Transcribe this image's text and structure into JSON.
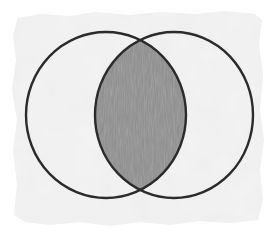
{
  "diagram": {
    "type": "venn",
    "sets": [
      {
        "name": "left-set",
        "cx": 106,
        "cy": 115,
        "rx": 80,
        "ry": 83
      },
      {
        "name": "right-set",
        "cx": 174,
        "cy": 115,
        "rx": 79,
        "ry": 83
      }
    ],
    "highlighted_region": "intersection",
    "colors": {
      "paper": "#f1f1f1",
      "stroke": "#2b2b2b",
      "shade": "#8e8e8e",
      "background": "#ffffff"
    }
  }
}
